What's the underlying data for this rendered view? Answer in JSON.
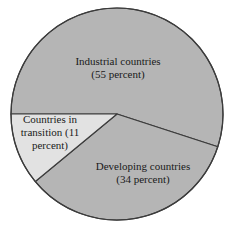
{
  "chart_data": {
    "type": "pie",
    "title": "",
    "subtitle": "",
    "xlabel": "",
    "ylabel": "",
    "grid": false,
    "legend_position": "none",
    "labels_inside_slices": true,
    "unit": "percent",
    "categories": [
      "Industrial countries",
      "Developing countries",
      "Countries in transition"
    ],
    "values": [
      55,
      34,
      11
    ],
    "slices": [
      {
        "name": "Industrial countries",
        "value": 55,
        "value_text": "(55 percent)",
        "label_text": "Industrial countries\n(55 percent)",
        "color": "#b5b5b5",
        "start_angle_deg": 180,
        "end_angle_deg": 378
      },
      {
        "name": "Developing countries",
        "value": 34,
        "value_text": "(34 percent)",
        "label_text": "Developing countries\n(34 percent)",
        "color": "#b5b5b5",
        "start_angle_deg": 378,
        "end_angle_deg": 500.4
      },
      {
        "name": "Countries in transition",
        "value": 11,
        "value_text": "(11 percent)",
        "label_text": "Countries in\ntransition (11\npercent)",
        "color": "#e2e2e2",
        "start_angle_deg": 500.4,
        "end_angle_deg": 540
      }
    ],
    "geometry": {
      "center_x": 117,
      "center_y": 114,
      "radius": 106
    },
    "style": {
      "outline_color": "#3c3c3c",
      "outline_width": 1.2,
      "background": "#ffffff",
      "text_color": "#1a1a1a"
    }
  }
}
